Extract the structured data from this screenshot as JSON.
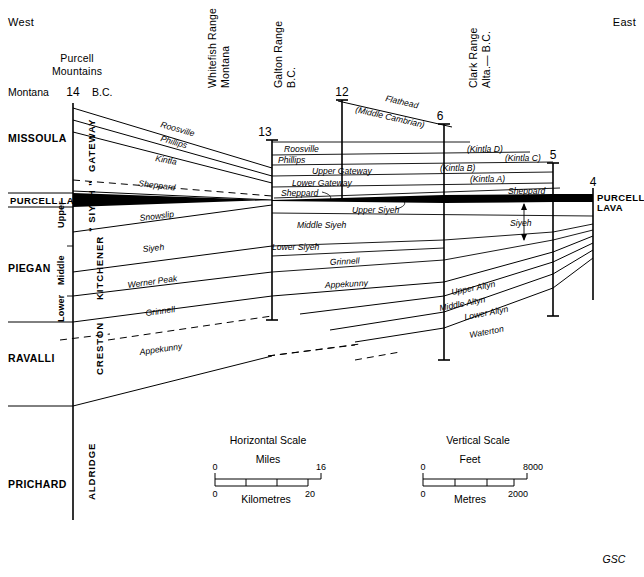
{
  "figure": {
    "title_credit": "GSC",
    "compass": {
      "west": "West",
      "east": "East"
    }
  },
  "locality_headers": [
    {
      "id": "purcell",
      "line1": "Purcell",
      "line2": "Mountains",
      "orientation": "horizontal"
    },
    {
      "id": "whitefish",
      "line1": "Whitefish Range",
      "line2": "Montana",
      "orientation": "vertical"
    },
    {
      "id": "galton",
      "line1": "Galton Range",
      "line2": "B.C.",
      "orientation": "vertical"
    },
    {
      "id": "clark",
      "line1": "Clark Range",
      "line2": "Alta.— B.C.",
      "orientation": "vertical"
    }
  ],
  "border_labels": {
    "left": "Montana",
    "right": "B.C."
  },
  "section_numbers": [
    {
      "label": "14",
      "x": 73
    },
    {
      "label": "13",
      "x": 265
    },
    {
      "label": "12",
      "x": 342
    },
    {
      "label": "6",
      "x": 440
    },
    {
      "label": "5",
      "x": 553
    },
    {
      "label": "4",
      "x": 593
    }
  ],
  "group_column": {
    "label": "Groups",
    "items": [
      {
        "name": "MISSOULA"
      },
      {
        "name": "PIEGAN"
      },
      {
        "name": "RAVALLI"
      },
      {
        "name": "PRICHARD"
      }
    ],
    "marker_band": "PURCELL LAVA"
  },
  "subdivision_column": [
    {
      "name": "Upper"
    },
    {
      "name": "Middle"
    },
    {
      "name": "Lower"
    }
  ],
  "formation_column": [
    {
      "name": "GATEWAY"
    },
    {
      "name": "“ SIYEH ”"
    },
    {
      "name": "KITCHENER"
    },
    {
      "name": "CRESTON"
    },
    {
      "name": "ALDRIDGE"
    }
  ],
  "formations_west": [
    {
      "name": "Roosville"
    },
    {
      "name": "Phillips"
    },
    {
      "name": "Kintla"
    },
    {
      "name": "Sheppard"
    },
    {
      "name": "Snowslip"
    },
    {
      "name": "Siyeh"
    },
    {
      "name": "Werner Peak"
    },
    {
      "name": "Grinnell"
    },
    {
      "name": "Appekunny"
    }
  ],
  "formations_centre": [
    {
      "name": "Roosville"
    },
    {
      "name": "Phillips"
    },
    {
      "name": "Upper   Gateway"
    },
    {
      "name": "Lower  Gateway"
    },
    {
      "name": "Sheppard"
    },
    {
      "name": "Upper  Siyeh"
    },
    {
      "name": "Middle   Siyeh"
    },
    {
      "name": "Lower Siyeh"
    },
    {
      "name": "Grinnell"
    },
    {
      "name": "Appekunny"
    }
  ],
  "formations_east": [
    {
      "name": "(Kintla D)"
    },
    {
      "name": "(Kintla C)"
    },
    {
      "name": "(Kintla B)"
    },
    {
      "name": "(Kintla A)"
    },
    {
      "name": "Sheppard"
    },
    {
      "name": "Siyeh"
    },
    {
      "name": "Upper Altyn"
    },
    {
      "name": "Middle Altyn"
    },
    {
      "name": "Lower Altyn"
    },
    {
      "name": "Waterton"
    }
  ],
  "overlying_unit": {
    "name": "Flathead",
    "age": "(Middle Cambrian)"
  },
  "purcell_lava_right": {
    "line1": "PURCELL",
    "line2": "LAVA"
  },
  "scales": {
    "horizontal": {
      "title": "Horizontal Scale",
      "primary_unit": "Miles",
      "primary_min": "0",
      "primary_max": "16",
      "secondary_unit": "Kilometres",
      "secondary_min": "0",
      "secondary_max": "20"
    },
    "vertical": {
      "title": "Vertical Scale",
      "primary_unit": "Feet",
      "primary_min": "0",
      "primary_max": "8000",
      "secondary_unit": "Metres",
      "secondary_min": "0",
      "secondary_max": "2000"
    }
  },
  "colors": {
    "ink": "#000000",
    "paper": "#ffffff",
    "lava": "#000000"
  }
}
